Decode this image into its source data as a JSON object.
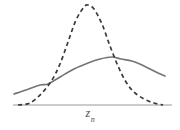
{
  "figure": {
    "background_color": "#ffffff",
    "width": 180,
    "height": 130
  },
  "axis": {
    "x_label_base": "z",
    "x_label_subscript": "n",
    "x_label_full": "z_n",
    "axis_color": "#9a9a9a",
    "baseline_y": 105,
    "x_start": 13,
    "x_end": 172
  },
  "chart_data": {
    "type": "line",
    "title": "",
    "xlabel": "z_n",
    "ylabel": "",
    "grid": false,
    "legend": null,
    "xlim": [
      13,
      172
    ],
    "ylim": [
      0,
      1
    ],
    "axis_only_x": true,
    "series": [
      {
        "name": "broad-solid-curve",
        "style": "solid",
        "color": "#757578",
        "description": "wide low-amplitude unimodal curve, peak right of center",
        "points_px": [
          [
            14,
            94
          ],
          [
            26,
            90
          ],
          [
            40,
            85
          ],
          [
            48,
            84
          ],
          [
            60,
            77
          ],
          [
            74,
            69
          ],
          [
            88,
            63
          ],
          [
            100,
            59
          ],
          [
            112,
            57
          ],
          [
            121,
            59
          ],
          [
            132,
            61
          ],
          [
            144,
            66
          ],
          [
            156,
            72
          ],
          [
            165,
            76
          ]
        ],
        "peak_px": [
          112,
          57
        ],
        "values_normalized": [
          0.12,
          0.16,
          0.21,
          0.22,
          0.29,
          0.37,
          0.43,
          0.47,
          0.49,
          0.47,
          0.45,
          0.4,
          0.34,
          0.3
        ]
      },
      {
        "name": "narrow-dashed-curve",
        "style": "dashed",
        "color": "#3a3a3c",
        "dash_pattern": [
          4.2,
          3.2
        ],
        "description": "tall narrow peaked curve centered left of center, tails on baseline",
        "points_px": [
          [
            18,
            105
          ],
          [
            30,
            103
          ],
          [
            42,
            93
          ],
          [
            52,
            80
          ],
          [
            60,
            64
          ],
          [
            68,
            42
          ],
          [
            76,
            20
          ],
          [
            84,
            7
          ],
          [
            88,
            5
          ],
          [
            94,
            9
          ],
          [
            102,
            24
          ],
          [
            110,
            46
          ],
          [
            118,
            66
          ],
          [
            126,
            82
          ],
          [
            134,
            92
          ],
          [
            144,
            99
          ],
          [
            154,
            103
          ],
          [
            163,
            105
          ]
        ],
        "peak_px": [
          88,
          5
        ],
        "values_normalized": [
          0.0,
          0.02,
          0.12,
          0.25,
          0.41,
          0.63,
          0.85,
          0.98,
          1.0,
          0.96,
          0.81,
          0.59,
          0.39,
          0.23,
          0.13,
          0.06,
          0.02,
          0.0
        ]
      }
    ],
    "intersections_px": [
      [
        48,
        84
      ],
      [
        121,
        59
      ]
    ],
    "annotations": []
  }
}
